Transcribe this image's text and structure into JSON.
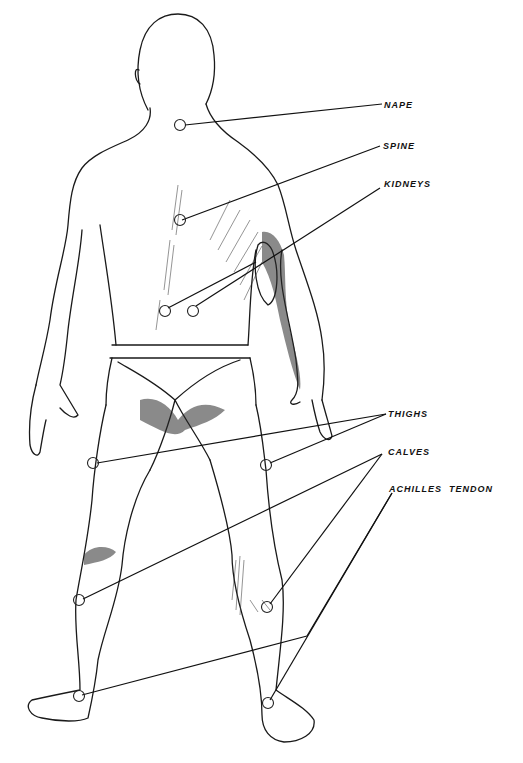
{
  "diagram": {
    "labels": {
      "nape": "NAPE",
      "spine": "SPINE",
      "kidneys": "KIDNEYS",
      "thighs": "THIGHS",
      "calves": "CALVES",
      "achilles": "ACHILLES  TENDON"
    },
    "points": [
      {
        "name": "nape",
        "label": "NAPE",
        "count": 1
      },
      {
        "name": "spine",
        "label": "SPINE",
        "count": 1
      },
      {
        "name": "kidneys",
        "label": "KIDNEYS",
        "count": 2
      },
      {
        "name": "thighs",
        "label": "THIGHS",
        "count": 2
      },
      {
        "name": "calves",
        "label": "CALVES",
        "count": 2
      },
      {
        "name": "achilles-tendon",
        "label": "ACHILLES TENDON",
        "count": 2
      }
    ]
  }
}
